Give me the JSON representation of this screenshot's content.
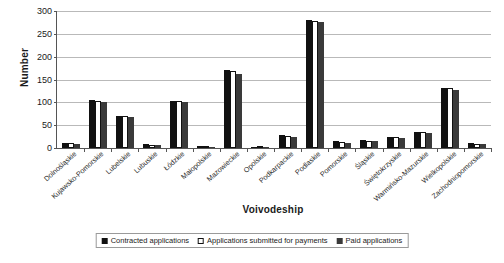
{
  "chart_data": {
    "type": "bar",
    "title": "",
    "xlabel": "Voivodeship",
    "ylabel": "Number",
    "ylim": [
      0,
      300
    ],
    "yticks": [
      0,
      50,
      100,
      150,
      200,
      250,
      300
    ],
    "grid": true,
    "legend_position": "bottom",
    "categories": [
      "Dolnośląskie",
      "Kujawsko-Pomorskie",
      "Lubelskie",
      "Lubuskie",
      "Łódzkie",
      "Małopolskie",
      "Mazowieckie",
      "Opolskie",
      "Podkarpackie",
      "Podlaskie",
      "Pomorskie",
      "Śląskie",
      "Świętokrzyskie",
      "Warmińsko-Mazurskie",
      "Wielkopolskie",
      "Zachodniopomorskie"
    ],
    "series": [
      {
        "name": "Contracted applications",
        "color": "#111111",
        "values": [
          10,
          105,
          71,
          8,
          103,
          4,
          170,
          1,
          28,
          280,
          15,
          17,
          25,
          36,
          132,
          10
        ]
      },
      {
        "name": "Applications submitted for payments",
        "color": "#ffffff",
        "values": [
          10,
          104,
          70,
          7,
          102,
          3,
          168,
          1,
          27,
          279,
          14,
          16,
          24,
          35,
          131,
          9
        ]
      },
      {
        "name": "Paid applications",
        "color": "#3a3a3a",
        "values": [
          9,
          100,
          67,
          6,
          100,
          2,
          163,
          1,
          25,
          277,
          11,
          15,
          22,
          33,
          128,
          8
        ]
      }
    ]
  },
  "legend": {
    "items": [
      {
        "label": "Contracted applications"
      },
      {
        "label": "Applications submitted for payments"
      },
      {
        "label": "Paid applications"
      }
    ]
  }
}
